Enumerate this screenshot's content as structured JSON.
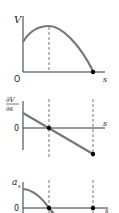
{
  "panels": [
    {
      "id": "potential",
      "ylabel": "V",
      "xlabel": "s",
      "origin_label": "O",
      "curve": "rises from positive intercept to maximum at dashed line, then falls to zero at marked point"
    },
    {
      "id": "gradient",
      "ylabel_num": "∂V",
      "ylabel_den": "∂s",
      "xlabel": "s",
      "origin_label": "0",
      "curve": "straight line decreasing, crossing zero at first dashed line, ending at marked point below axis"
    },
    {
      "id": "acceleration",
      "ylabel": "a",
      "ylabel_sub": "s",
      "xlabel": "s",
      "origin_label": "0",
      "curve": "starts positive, decreases to zero at first dashed line, continues negative"
    }
  ],
  "colors": {
    "curve": "#777777",
    "axis": "#333333",
    "dash": "#555555",
    "point": "#000000"
  }
}
